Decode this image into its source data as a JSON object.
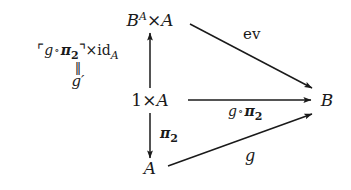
{
  "diagram": {
    "background_color": "#ffffff",
    "ink_color": "#1a1a1a",
    "nodes": [
      {
        "id": "top",
        "name": "exponential-product-object",
        "base": "B",
        "superscript": "A",
        "operator": "×",
        "operand": "A",
        "text": "B^A×A",
        "x": 150,
        "y": 20
      },
      {
        "id": "middle",
        "name": "terminal-product-object",
        "base": "1",
        "operator": "×",
        "operand": "A",
        "text": "1×A",
        "x": 150,
        "y": 100
      },
      {
        "id": "bottom",
        "name": "object-a",
        "text": "A",
        "x": 150,
        "y": 168
      },
      {
        "id": "right",
        "name": "object-b",
        "text": "B",
        "x": 327,
        "y": 100
      }
    ],
    "arrows": [
      {
        "id": "vertical-up",
        "name": "arrow-middle-to-top",
        "from": "middle",
        "to": "top",
        "direction": "up",
        "x1": 150,
        "y1": 88,
        "x2": 150,
        "y2": 33
      },
      {
        "id": "vertical-down",
        "name": "arrow-middle-to-bottom",
        "from": "middle",
        "to": "bottom",
        "direction": "down",
        "x1": 150,
        "y1": 113,
        "x2": 150,
        "y2": 158
      },
      {
        "id": "diagonal-ev",
        "name": "arrow-top-to-right",
        "from": "top",
        "to": "right",
        "direction": "down-right",
        "x1": 190,
        "y1": 24,
        "x2": 312,
        "y2": 88
      },
      {
        "id": "horizontal",
        "name": "arrow-middle-to-right",
        "from": "middle",
        "to": "right",
        "direction": "right",
        "x1": 188,
        "y1": 100,
        "x2": 311,
        "y2": 100
      },
      {
        "id": "diagonal-g",
        "name": "arrow-bottom-to-right",
        "from": "bottom",
        "to": "right",
        "direction": "up-right",
        "x1": 168,
        "y1": 166,
        "x2": 312,
        "y2": 114
      }
    ],
    "labels": [
      {
        "id": "label-exponential-transpose",
        "name": "label-exponential-transpose",
        "line1_prefix": "⌜",
        "line1_fn": "g",
        "line1_ring": "∘",
        "line1_pi": "π",
        "line1_pi_sub": "2",
        "line1_suffix": "⌝",
        "line1_times": "×",
        "line1_id": "id",
        "line1_id_sub": "A",
        "line1_text": "⌜g∘π₂⌝×id_A",
        "line2_text": "‖",
        "line3_text": "g′",
        "x": 78,
        "y": 42,
        "attached_to": "vertical-up"
      },
      {
        "id": "label-ev",
        "name": "label-evaluation-map",
        "text": "ev",
        "x": 243,
        "y": 27,
        "attached_to": "diagonal-ev"
      },
      {
        "id": "label-g-pi2",
        "name": "label-g-compose-pi2",
        "fn": "g",
        "ring": "∘",
        "pi": "π",
        "pi_sub": "2",
        "text": "g∘π₂",
        "x": 228,
        "y": 104,
        "attached_to": "horizontal"
      },
      {
        "id": "label-pi2",
        "name": "label-pi2-projection",
        "pi": "π",
        "pi_sub": "2",
        "text": "π₂",
        "x": 160,
        "y": 126,
        "attached_to": "vertical-down"
      },
      {
        "id": "label-g",
        "name": "label-g-morphism",
        "text": "g",
        "x": 245,
        "y": 148,
        "attached_to": "diagonal-g"
      }
    ]
  }
}
